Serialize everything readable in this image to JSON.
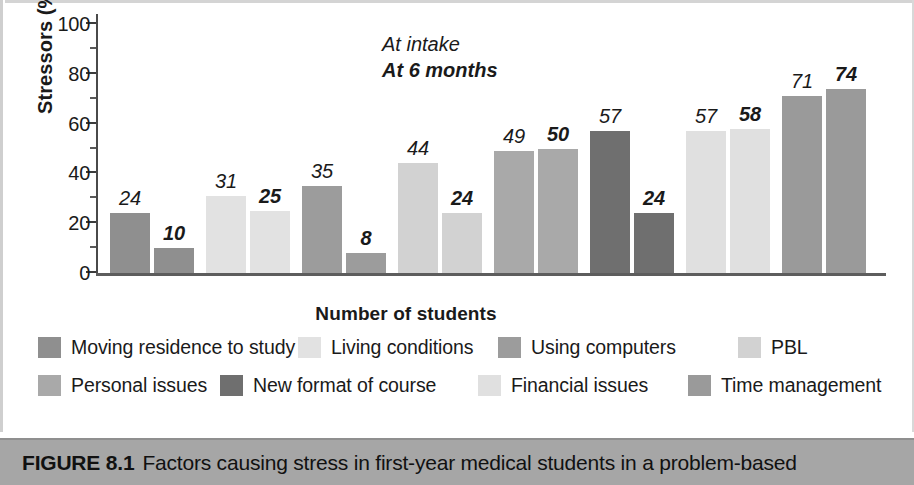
{
  "figure": {
    "caption_label": "FIGURE 8.1",
    "caption_text": "Factors causing stress in first-year medical students in a problem-based"
  },
  "chart_data": {
    "type": "bar",
    "title": "",
    "xlabel": "Number of students",
    "ylabel": "Stressors (%)",
    "ylim": [
      0,
      100
    ],
    "yticks": [
      0,
      20,
      40,
      60,
      80,
      100
    ],
    "yticks_minor": [
      10,
      30,
      50,
      70,
      90
    ],
    "grid": false,
    "legend_position": "bottom",
    "categories": [
      "Moving residence to study",
      "Living conditions",
      "Using computers",
      "PBL",
      "Personal issues",
      "New format of course",
      "Financial issues",
      "Time management"
    ],
    "series": [
      {
        "name": "At intake",
        "style": "italic",
        "values": [
          24,
          31,
          35,
          44,
          49,
          57,
          57,
          71
        ]
      },
      {
        "name": "At 6 months",
        "style": "bold-italic",
        "values": [
          10,
          25,
          8,
          24,
          50,
          24,
          58,
          74
        ]
      }
    ],
    "group_colors": [
      "#8f8f8f",
      "#e2e2e2",
      "#9c9c9c",
      "#d2d2d2",
      "#a9a9a9",
      "#6f6f6f",
      "#e0e0e0",
      "#9a9a9a"
    ],
    "annotations": [
      {
        "text": "At intake",
        "style": "italic"
      },
      {
        "text": "At 6 months",
        "style": "bold-italic"
      }
    ]
  },
  "legend": {
    "items": [
      {
        "label": "Moving residence to study",
        "color": "#8f8f8f"
      },
      {
        "label": "Living conditions",
        "color": "#e2e2e2"
      },
      {
        "label": "Using computers",
        "color": "#9c9c9c"
      },
      {
        "label": "PBL",
        "color": "#d2d2d2"
      },
      {
        "label": "Personal issues",
        "color": "#a9a9a9"
      },
      {
        "label": "New format of course",
        "color": "#6f6f6f"
      },
      {
        "label": "Financial issues",
        "color": "#e0e0e0"
      },
      {
        "label": "Time management",
        "color": "#9a9a9a"
      }
    ]
  }
}
